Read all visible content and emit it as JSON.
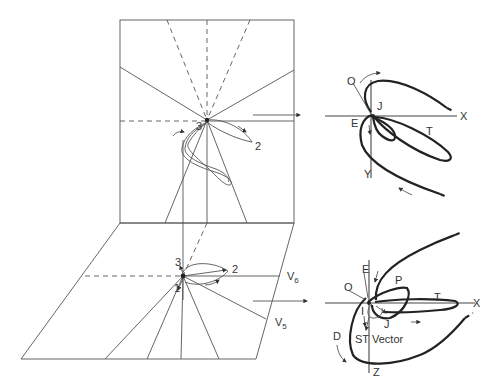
{
  "figure": {
    "type": "vectorcardiogram-projection-diagram",
    "frontal_plane": {
      "lead_labels": [
        "3",
        "2"
      ]
    },
    "horizontal_plane": {
      "lead_labels": [
        "3",
        "2",
        "1"
      ],
      "chest_leads": {
        "v6": "V",
        "v6_sub": "6",
        "v5": "V",
        "v5_sub": "5"
      }
    },
    "frontal_loop": {
      "labels": {
        "onset": "O",
        "e_point": "E",
        "j_point": "J",
        "t_loop": "T",
        "x_axis": "X",
        "y_axis": "Y"
      }
    },
    "horizontal_loop": {
      "labels": {
        "e_point": "E",
        "onset": "O",
        "p_loop": "P",
        "t_loop": "T",
        "x_axis": "X",
        "l_point": "I",
        "j_point": "J",
        "d_label": "D",
        "st_vector": "ST",
        "vector_word": "Vector",
        "z_axis": "Z"
      }
    }
  }
}
